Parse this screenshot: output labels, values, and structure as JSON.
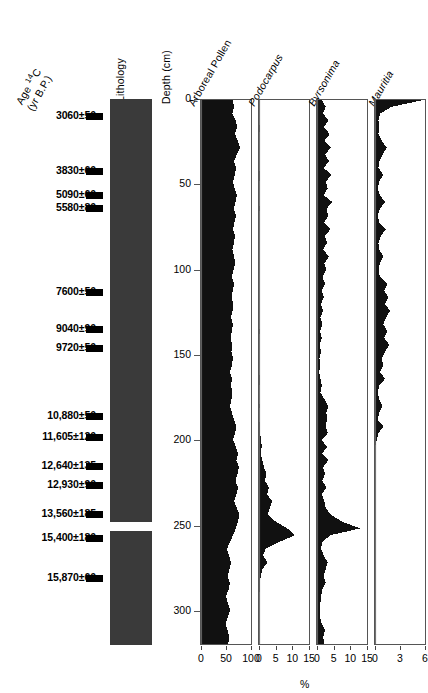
{
  "figure": {
    "type": "pollen-diagram",
    "depth_unit": "cm",
    "percent_label": "%"
  },
  "columns": {
    "age_header_line1": "Age 14C",
    "age_header_line2": "(yr B.P.)",
    "lithology_header": "Lithology",
    "depth_header": "Depth (cm)"
  },
  "ages": [
    {
      "label": "3060±50",
      "depth": 10
    },
    {
      "label": "3830±60",
      "depth": 42
    },
    {
      "label": "5090±60",
      "depth": 56
    },
    {
      "label": "5580±80",
      "depth": 64
    },
    {
      "label": "7600±50",
      "depth": 113
    },
    {
      "label": "9040±90",
      "depth": 135
    },
    {
      "label": "9720±50",
      "depth": 146
    },
    {
      "label": "10,880±50",
      "depth": 186
    },
    {
      "label": "11,605±120",
      "depth": 198
    },
    {
      "label": "12,640±135",
      "depth": 215
    },
    {
      "label": "12,930±90",
      "depth": 226
    },
    {
      "label": "13,560±185",
      "depth": 243
    },
    {
      "label": "15,400±180",
      "depth": 257
    },
    {
      "label": "15,870±60",
      "depth": 281
    }
  ],
  "lithology": {
    "fill_color": "#3a3a3a",
    "top_depth": 0,
    "bottom_depth": 320,
    "bands": [
      {
        "from_depth": 248,
        "to_depth": 253,
        "color": "#ffffff"
      }
    ]
  },
  "depth_axis": {
    "label": "Depth (cm)",
    "min": 0,
    "max": 320,
    "ticks": [
      0,
      50,
      100,
      150,
      200,
      250,
      300
    ]
  },
  "chart_data": [
    {
      "type": "area",
      "title": "Arboreal Pollen",
      "italic": false,
      "xlabel": "%",
      "ylabel": "Depth (cm)",
      "xlim": [
        0,
        100
      ],
      "ylim": [
        320,
        0
      ],
      "xticks": [
        0,
        50,
        100
      ],
      "fill": "#111111",
      "depths": [
        0,
        4,
        8,
        12,
        16,
        20,
        24,
        28,
        32,
        36,
        40,
        44,
        48,
        52,
        56,
        60,
        64,
        68,
        72,
        76,
        80,
        84,
        88,
        92,
        96,
        100,
        104,
        108,
        112,
        116,
        120,
        124,
        128,
        132,
        136,
        140,
        144,
        148,
        152,
        156,
        160,
        164,
        168,
        172,
        176,
        180,
        184,
        188,
        192,
        196,
        200,
        204,
        208,
        212,
        216,
        220,
        224,
        228,
        232,
        236,
        240,
        244,
        248,
        252,
        256,
        260,
        264,
        268,
        272,
        276,
        280,
        284,
        288,
        292,
        296,
        300,
        304,
        308,
        312,
        316,
        320
      ],
      "values": [
        64,
        66,
        63,
        70,
        72,
        68,
        74,
        78,
        72,
        66,
        70,
        68,
        64,
        67,
        72,
        69,
        66,
        70,
        67,
        64,
        68,
        66,
        63,
        66,
        69,
        65,
        62,
        66,
        64,
        61,
        65,
        63,
        60,
        64,
        62,
        59,
        63,
        61,
        64,
        62,
        58,
        62,
        60,
        63,
        61,
        58,
        62,
        66,
        71,
        68,
        64,
        70,
        74,
        71,
        76,
        73,
        69,
        74,
        71,
        66,
        72,
        77,
        74,
        70,
        64,
        58,
        52,
        56,
        60,
        57,
        53,
        58,
        55,
        50,
        54,
        58,
        54,
        49,
        53,
        57,
        54
      ]
    },
    {
      "type": "area",
      "title": "Podocarpus",
      "italic": true,
      "xlabel": "%",
      "xlim": [
        0,
        15
      ],
      "ylim": [
        320,
        0
      ],
      "xticks": [
        0,
        5,
        10,
        15
      ],
      "fill": "#111111",
      "depths": [
        0,
        4,
        8,
        12,
        16,
        20,
        24,
        28,
        32,
        36,
        40,
        44,
        48,
        52,
        56,
        60,
        64,
        68,
        72,
        76,
        80,
        84,
        88,
        92,
        96,
        100,
        104,
        108,
        112,
        116,
        120,
        124,
        128,
        132,
        136,
        140,
        144,
        148,
        152,
        156,
        160,
        164,
        168,
        172,
        176,
        180,
        184,
        188,
        192,
        196,
        200,
        204,
        208,
        212,
        216,
        220,
        224,
        228,
        232,
        236,
        240,
        244,
        248,
        252,
        256,
        260,
        264,
        268,
        272,
        276,
        280,
        284,
        288,
        292,
        296,
        300,
        304,
        308,
        312,
        316,
        320
      ],
      "values": [
        0,
        0,
        0,
        0,
        0.2,
        0.1,
        0,
        0,
        0.1,
        0,
        0,
        0.3,
        0.1,
        0,
        0,
        0,
        0.2,
        0,
        0,
        0,
        0,
        0.1,
        0,
        0,
        0,
        0,
        0.1,
        0,
        0,
        0,
        0,
        0,
        0,
        0,
        0.2,
        0,
        0,
        0,
        0,
        0,
        0,
        0.3,
        0.1,
        0,
        0,
        0.2,
        0,
        0,
        0.4,
        0.3,
        0.6,
        0.8,
        0.5,
        1.0,
        1.5,
        2.2,
        1.8,
        3.0,
        2.4,
        4.0,
        3.2,
        2.6,
        5.0,
        8.5,
        10.8,
        6.0,
        2.0,
        1.2,
        2.5,
        1.0,
        0.5,
        0.3,
        0.2,
        0,
        0,
        0.1,
        0,
        0,
        0,
        0,
        0
      ]
    },
    {
      "type": "area",
      "title": "Byrsonima",
      "italic": true,
      "xlabel": "%",
      "xlim": [
        0,
        15
      ],
      "ylim": [
        320,
        0
      ],
      "xticks": [
        0,
        5,
        10,
        15
      ],
      "fill": "#111111",
      "depths": [
        0,
        4,
        8,
        12,
        16,
        20,
        24,
        28,
        32,
        36,
        40,
        44,
        48,
        52,
        56,
        60,
        64,
        68,
        72,
        76,
        80,
        84,
        88,
        92,
        96,
        100,
        104,
        108,
        112,
        116,
        120,
        124,
        128,
        132,
        136,
        140,
        144,
        148,
        152,
        156,
        160,
        164,
        168,
        172,
        176,
        180,
        184,
        188,
        192,
        196,
        200,
        204,
        208,
        212,
        216,
        220,
        224,
        228,
        232,
        236,
        240,
        244,
        248,
        252,
        256,
        260,
        264,
        268,
        272,
        276,
        280,
        284,
        288,
        292,
        296,
        300,
        304,
        308,
        312,
        316,
        320
      ],
      "values": [
        1.5,
        2.6,
        1.8,
        3.4,
        2.0,
        3.8,
        2.2,
        4.2,
        2.4,
        3.6,
        2.0,
        4.4,
        2.6,
        3.2,
        2.0,
        4.6,
        2.8,
        3.4,
        2.2,
        4.0,
        2.4,
        3.0,
        1.8,
        3.6,
        2.2,
        2.8,
        1.6,
        2.4,
        1.4,
        2.0,
        1.2,
        1.8,
        1.0,
        1.6,
        0.9,
        1.4,
        0.8,
        1.2,
        0.7,
        1.0,
        0.6,
        1.0,
        1.4,
        1.0,
        2.2,
        3.4,
        2.8,
        3.0,
        2.6,
        3.2,
        1.4,
        3.0,
        1.6,
        3.4,
        1.8,
        2.4,
        1.6,
        2.8,
        1.4,
        2.2,
        2.6,
        4.2,
        7.5,
        13.0,
        4.0,
        1.6,
        1.2,
        2.0,
        3.2,
        2.6,
        2.0,
        2.6,
        1.6,
        1.2,
        1.0,
        0.8,
        0.9,
        1.4,
        2.4,
        1.8,
        2.2
      ]
    },
    {
      "type": "area",
      "title": "Mauritia",
      "italic": true,
      "xlabel": "%",
      "xlim": [
        0,
        6
      ],
      "ylim": [
        320,
        0
      ],
      "xticks": [
        0,
        3,
        6
      ],
      "fill": "#111111",
      "depths": [
        0,
        4,
        8,
        12,
        16,
        20,
        24,
        28,
        32,
        36,
        40,
        44,
        48,
        52,
        56,
        60,
        64,
        68,
        72,
        76,
        80,
        84,
        88,
        92,
        96,
        100,
        104,
        108,
        112,
        116,
        120,
        124,
        128,
        132,
        136,
        140,
        144,
        148,
        152,
        156,
        160,
        164,
        168,
        172,
        176,
        180,
        184,
        188,
        192,
        196,
        200,
        204,
        208,
        212,
        216,
        220,
        224,
        228,
        232,
        236,
        240,
        244,
        248,
        252,
        256,
        260,
        264,
        268,
        272,
        276,
        280,
        284,
        288,
        292,
        296,
        300,
        304,
        308,
        312,
        316,
        320
      ],
      "values": [
        5.8,
        2.0,
        0.6,
        0.4,
        0.5,
        0.4,
        0.8,
        1.4,
        0.9,
        0.5,
        0.4,
        1.0,
        0.5,
        0.3,
        0.6,
        1.2,
        0.6,
        0.3,
        0.5,
        1.3,
        0.7,
        0.4,
        0.5,
        1.0,
        0.6,
        0.4,
        0.6,
        1.5,
        1.1,
        1.6,
        1.2,
        1.8,
        1.3,
        1.0,
        1.5,
        1.1,
        1.7,
        1.2,
        0.8,
        1.0,
        0.6,
        1.2,
        0.5,
        0.3,
        0.5,
        0.9,
        0.5,
        0.3,
        1.0,
        0.4,
        0.2,
        0,
        0,
        0,
        0,
        0,
        0,
        0,
        0,
        0,
        0,
        0,
        0,
        0,
        0,
        0,
        0,
        0,
        0,
        0,
        0,
        0,
        0,
        0,
        0,
        0,
        0,
        0,
        0,
        0,
        0
      ]
    }
  ]
}
